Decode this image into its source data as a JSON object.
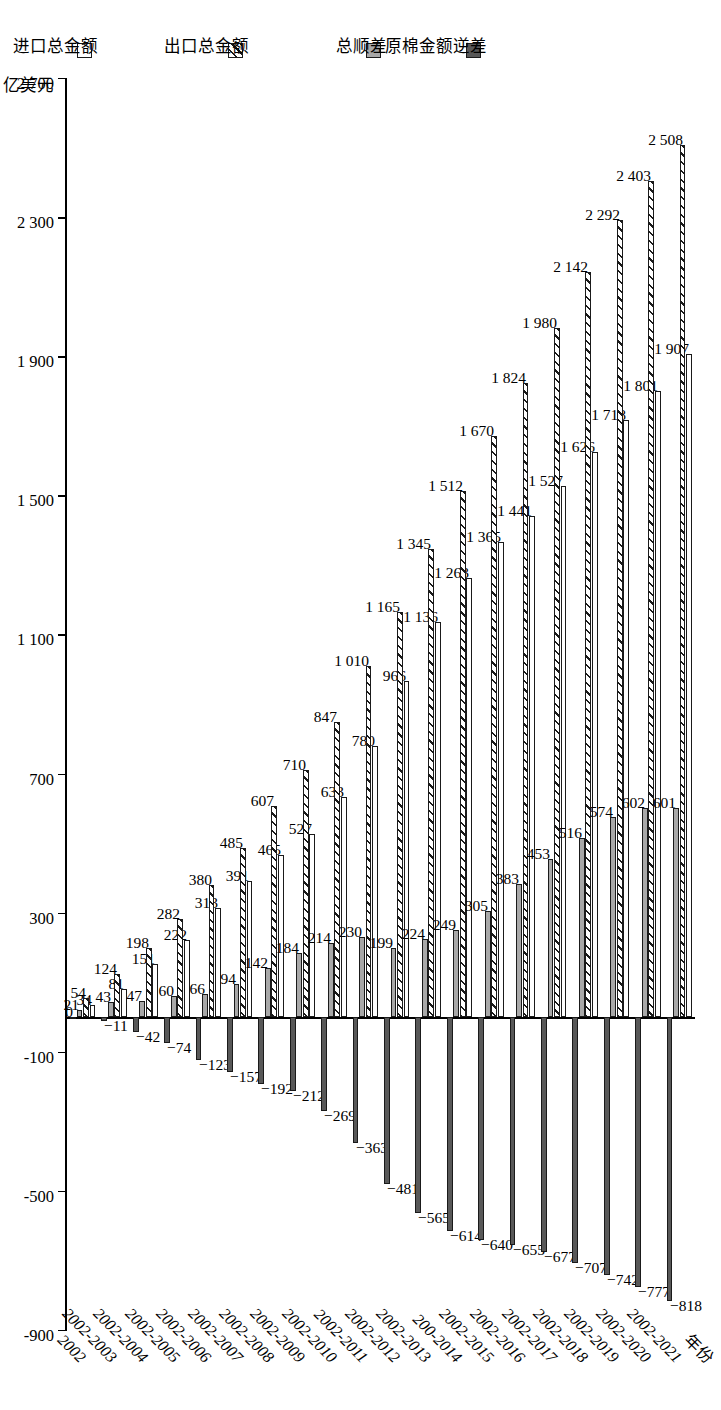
{
  "axis": {
    "unit_label": "亿美元",
    "category_axis_title": "年份",
    "value_ticks": [
      "2 700",
      "2 300",
      "1 900",
      "1 500",
      "1 100",
      "700",
      "300",
      "-100",
      "-500",
      "-900"
    ],
    "value_tick_numbers": [
      2700,
      2300,
      1900,
      1500,
      1100,
      700,
      300,
      -100,
      -500,
      -900
    ],
    "ylim": [
      -900,
      2700
    ]
  },
  "legend": {
    "items": [
      {
        "label": "进口总金额",
        "swatch": "white-outline",
        "color": "#ffffff"
      },
      {
        "label": "出口总金额",
        "swatch": "hatched",
        "color": "#ffffff"
      },
      {
        "label": "总顺差",
        "swatch": "light-gray",
        "color": "#a8a8a8"
      },
      {
        "label": "原棉金额逆差",
        "swatch": "dark-gray",
        "color": "#585858"
      }
    ]
  },
  "chart_data": {
    "type": "bar",
    "title": "",
    "xlabel": "年份",
    "ylabel": "亿美元",
    "ylim": [
      -900,
      2700
    ],
    "grid": false,
    "legend_position": "left",
    "orientation": "horizontal-grouped",
    "categories": [
      "2002",
      "2002-2003",
      "2002-2004",
      "2002-2005",
      "2002-2006",
      "2002-2007",
      "2002-2008",
      "2002-2009",
      "2002-2010",
      "2002-2011",
      "2002-2012",
      "2002-2013",
      "200-2014",
      "2002-2015",
      "2002-2016",
      "2002-2017",
      "2002-2018",
      "2002-2019",
      "2002-2020",
      "2002-2021"
    ],
    "series": [
      {
        "name": "进口总金额",
        "values": [
          34,
          81,
          151,
          222,
          313,
          391,
          465,
          527,
          633,
          780,
          966,
          1136,
          1263,
          1365,
          1441,
          1527,
          1626,
          1718,
          1801,
          1907
        ]
      },
      {
        "name": "出口总金额",
        "values": [
          54,
          124,
          198,
          282,
          380,
          485,
          607,
          710,
          847,
          1010,
          1165,
          1345,
          1512,
          1670,
          1824,
          1980,
          2142,
          2292,
          2403,
          2508
        ]
      },
      {
        "name": "总顺差",
        "values": [
          21,
          43,
          47,
          60,
          66,
          94,
          142,
          184,
          214,
          230,
          199,
          224,
          249,
          305,
          383,
          453,
          516,
          574,
          602,
          601
        ]
      },
      {
        "name": "原棉金额逆差",
        "values": [
          0,
          -11,
          -42,
          -74,
          -123,
          -157,
          -192,
          -212,
          -269,
          -363,
          -481,
          -565,
          -614,
          -640,
          -655,
          -677,
          -707,
          -742,
          -777,
          -818
        ]
      }
    ]
  }
}
